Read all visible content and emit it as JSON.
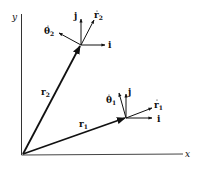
{
  "diagram": {
    "type": "vector-diagram",
    "axes": {
      "x_label": "x",
      "y_label": "y"
    },
    "colors": {
      "ink": "#111111",
      "background": "#ffffff"
    },
    "position_vectors": [
      {
        "name": "r1",
        "label": "r",
        "subscript": "1"
      },
      {
        "name": "r2",
        "label": "r",
        "subscript": "2"
      }
    ],
    "point1_unit_vectors": {
      "i": "i",
      "j": "j",
      "r_hat": "r",
      "r_hat_sub": "1",
      "theta_hat": "θ",
      "theta_hat_sub": "1"
    },
    "point2_unit_vectors": {
      "i": "i",
      "j": "j",
      "r_hat": "r",
      "r_hat_sub": "2",
      "theta_hat": "θ",
      "theta_hat_sub": "2"
    }
  }
}
